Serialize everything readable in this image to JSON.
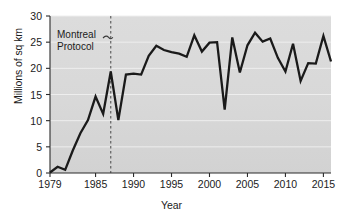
{
  "chart_data": {
    "type": "line",
    "title": "",
    "xlabel": "Year",
    "ylabel": "Millions of sq km",
    "xlim": [
      1979,
      2016
    ],
    "ylim": [
      0,
      30
    ],
    "grid": true,
    "legend": "none",
    "xticks": [
      1979,
      1985,
      1990,
      1995,
      2000,
      2005,
      2010,
      2015
    ],
    "xtick_labels": [
      "1979",
      "1985",
      "1990",
      "1995",
      "2000",
      "2005",
      "2010",
      "2015"
    ],
    "yticks": [
      0,
      5,
      10,
      15,
      20,
      25,
      30
    ],
    "ytick_labels": [
      "0",
      "5",
      "10",
      "15",
      "20",
      "25",
      "30"
    ],
    "line_color": "#1a1a1a",
    "plot_background": "#d8d8d8",
    "x": [
      1979,
      1980,
      1981,
      1982,
      1983,
      1984,
      1985,
      1986,
      1987,
      1988,
      1989,
      1990,
      1991,
      1992,
      1993,
      1994,
      1995,
      1996,
      1997,
      1998,
      1999,
      2000,
      2001,
      2002,
      2003,
      2004,
      2005,
      2006,
      2007,
      2008,
      2009,
      2010,
      2011,
      2012,
      2013,
      2014,
      2015,
      2016
    ],
    "values": [
      0.1,
      1.2,
      0.6,
      4.3,
      7.6,
      10.1,
      14.6,
      11.3,
      19.4,
      10.1,
      18.8,
      19.0,
      18.8,
      22.4,
      24.3,
      23.5,
      23.1,
      22.8,
      22.2,
      26.3,
      23.2,
      24.9,
      25.0,
      12.1,
      25.9,
      19.2,
      24.4,
      26.8,
      25.1,
      25.7,
      22.0,
      19.4,
      24.7,
      17.6,
      21.0,
      20.9,
      26.2,
      21.3
    ],
    "annotations": [
      {
        "text": "Montreal\nProtocol",
        "x": 1987,
        "note": "dashed vertical reference line at 1987 with curly leader from label"
      }
    ],
    "reference_lines": [
      {
        "orientation": "vertical",
        "x": 1987,
        "style": "dashed",
        "color": "#555555"
      }
    ]
  }
}
